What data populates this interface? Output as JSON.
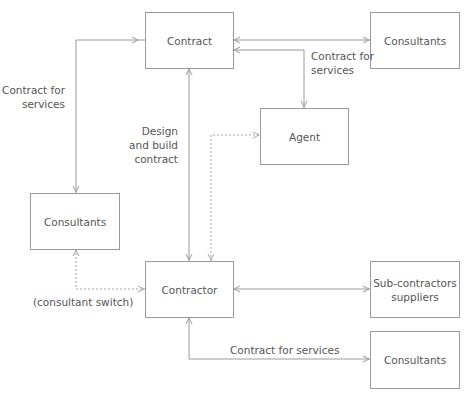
{
  "diagram": {
    "type": "contractual-relationships",
    "colors": {
      "line": "#9a9a9a",
      "text": "#555555",
      "background": "#ffffff"
    },
    "nodes": {
      "contract": {
        "label": "Contract"
      },
      "consultants_top": {
        "label": "Consultants"
      },
      "agent": {
        "label": "Agent"
      },
      "consultants_left": {
        "label": "Consultants"
      },
      "contractor": {
        "label": "Contractor"
      },
      "subcontractors": {
        "label": "Sub-contractors\nsuppliers"
      },
      "consultants_bottom": {
        "label": "Consultants"
      }
    },
    "edge_labels": {
      "left_services": "Contract for\nservices",
      "top_services": "Contract for\nservices",
      "design_build": "Design\nand build\ncontract",
      "consultant_switch": "(consultant switch)",
      "bottom_services": "Contract for services"
    },
    "edges": [
      {
        "from": "contract",
        "to": "consultants_left",
        "style": "solid",
        "label": "Contract for services",
        "arrows": "both"
      },
      {
        "from": "contract",
        "to": "consultants_top",
        "style": "solid",
        "arrows": "both"
      },
      {
        "from": "contract",
        "to": "agent",
        "style": "solid",
        "label": "Contract for services",
        "arrows": "both"
      },
      {
        "from": "contract",
        "to": "contractor",
        "style": "solid",
        "label": "Design and build contract",
        "arrows": "both"
      },
      {
        "from": "contractor",
        "to": "agent",
        "style": "dashed",
        "arrows": "both"
      },
      {
        "from": "consultants_left",
        "to": "contractor",
        "style": "dashed",
        "label": "(consultant switch)",
        "arrows": "both"
      },
      {
        "from": "contractor",
        "to": "subcontractors",
        "style": "solid",
        "arrows": "both"
      },
      {
        "from": "contractor",
        "to": "consultants_bottom",
        "style": "solid",
        "label": "Contract for services",
        "arrows": "both"
      }
    ]
  }
}
